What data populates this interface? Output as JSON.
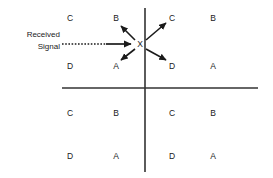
{
  "diagram": {
    "background_color": "#ffffff",
    "line_color": "#333333",
    "text_color": "#1a1a1a",
    "width": 273,
    "height": 178
  },
  "annotation": {
    "signal_line_1": "Received",
    "signal_line_2": "Signal",
    "center_marker": "X"
  },
  "axes": {
    "vertical": {
      "x": 145,
      "y1": 8,
      "y2": 172
    },
    "horizontal": {
      "y": 88,
      "x1": 62,
      "x2": 258
    }
  },
  "cells": [
    {
      "label": "C",
      "x": 70,
      "y": 18,
      "quadrant": "upper-left",
      "name": "cell-ul-outer-c"
    },
    {
      "label": "B",
      "x": 116,
      "y": 18,
      "quadrant": "upper-left",
      "name": "cell-ul-inner-b"
    },
    {
      "label": "C",
      "x": 172,
      "y": 18,
      "quadrant": "upper-right",
      "name": "cell-ur-inner-c"
    },
    {
      "label": "B",
      "x": 213,
      "y": 18,
      "quadrant": "upper-right",
      "name": "cell-ur-outer-b"
    },
    {
      "label": "D",
      "x": 70,
      "y": 66,
      "quadrant": "upper-left",
      "name": "cell-ul-outer-d"
    },
    {
      "label": "A",
      "x": 116,
      "y": 66,
      "quadrant": "upper-left",
      "name": "cell-ul-inner-a"
    },
    {
      "label": "D",
      "x": 172,
      "y": 66,
      "quadrant": "upper-right",
      "name": "cell-ur-inner-d"
    },
    {
      "label": "A",
      "x": 213,
      "y": 66,
      "quadrant": "upper-right",
      "name": "cell-ur-outer-a"
    },
    {
      "label": "C",
      "x": 70,
      "y": 113,
      "quadrant": "lower-left",
      "name": "cell-ll-outer-c"
    },
    {
      "label": "B",
      "x": 116,
      "y": 113,
      "quadrant": "lower-left",
      "name": "cell-ll-inner-b"
    },
    {
      "label": "C",
      "x": 172,
      "y": 113,
      "quadrant": "lower-right",
      "name": "cell-lr-inner-c"
    },
    {
      "label": "B",
      "x": 213,
      "y": 113,
      "quadrant": "lower-right",
      "name": "cell-lr-outer-b"
    },
    {
      "label": "D",
      "x": 70,
      "y": 156,
      "quadrant": "lower-left",
      "name": "cell-ll-outer-d"
    },
    {
      "label": "A",
      "x": 116,
      "y": 156,
      "quadrant": "lower-left",
      "name": "cell-ll-inner-a"
    },
    {
      "label": "D",
      "x": 172,
      "y": 156,
      "quadrant": "lower-right",
      "name": "cell-lr-inner-d"
    },
    {
      "label": "A",
      "x": 213,
      "y": 156,
      "quadrant": "lower-right",
      "name": "cell-lr-outer-a"
    }
  ],
  "arrows": [
    {
      "name": "incoming-signal-arrow",
      "from": [
        62,
        44
      ],
      "to": [
        134,
        44
      ],
      "style": "dashed",
      "target": "X"
    },
    {
      "name": "arrow-to-b",
      "from": [
        134,
        40
      ],
      "to": [
        119,
        24
      ],
      "style": "solid",
      "target": "B"
    },
    {
      "name": "arrow-to-c",
      "from": [
        147,
        40
      ],
      "to": [
        168,
        22
      ],
      "style": "solid",
      "target": "C"
    },
    {
      "name": "arrow-to-a",
      "from": [
        134,
        49
      ],
      "to": [
        119,
        61
      ],
      "style": "solid",
      "target": "A"
    },
    {
      "name": "arrow-to-d",
      "from": [
        147,
        49
      ],
      "to": [
        168,
        61
      ],
      "style": "solid",
      "target": "D"
    }
  ]
}
